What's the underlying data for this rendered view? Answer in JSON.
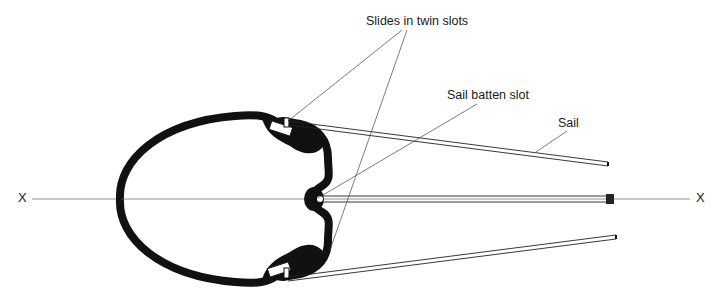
{
  "diagram": {
    "labels": {
      "slides": "Slides in twin slots",
      "batten": "Sail batten slot",
      "sail": "Sail"
    },
    "axis": {
      "left_marker": "X",
      "right_marker": "X"
    },
    "colors": {
      "ink": "#111111",
      "leader": "#444444",
      "background": "#ffffff"
    }
  }
}
